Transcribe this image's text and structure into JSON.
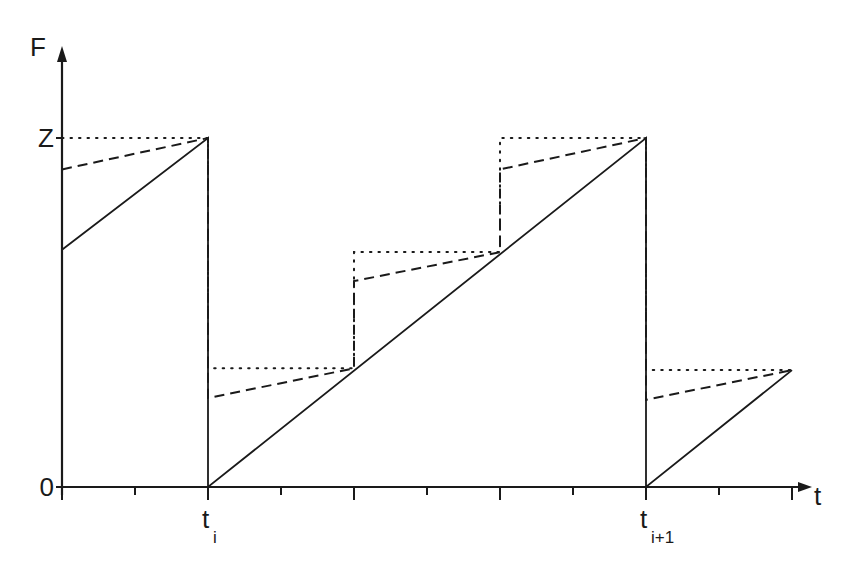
{
  "chart_data": {
    "type": "line",
    "title": "",
    "xlabel": "t",
    "ylabel": "F",
    "y_tick_labels": [
      {
        "label": "0",
        "value": 0
      },
      {
        "label": "Z",
        "value": 1
      }
    ],
    "x_tick_labels": [
      {
        "base": "t",
        "sub": "i",
        "value": 2
      },
      {
        "base": "t",
        "sub": "i+1",
        "value": 8
      }
    ],
    "x_ticks": [
      0,
      1,
      2,
      3,
      4,
      5,
      6,
      7,
      8,
      9,
      10
    ],
    "xlim": [
      0,
      10.2
    ],
    "ylim": [
      0,
      1.0
    ],
    "grid": false,
    "y_units_note": "fraction of Z",
    "series": [
      {
        "name": "solid",
        "style": "solid",
        "points": [
          [
            0,
            0.68
          ],
          [
            2,
            1.0
          ],
          [
            2,
            0
          ],
          [
            8,
            1.0
          ],
          [
            8,
            0
          ],
          [
            10,
            0.335
          ]
        ]
      },
      {
        "name": "dashed",
        "style": "dashed",
        "points": [
          [
            0,
            0.91
          ],
          [
            2,
            1.0
          ],
          [
            2,
            0.255
          ],
          [
            4,
            0.34
          ],
          [
            4,
            0.59
          ],
          [
            6,
            0.673
          ],
          [
            6,
            0.91
          ],
          [
            8,
            1.0
          ],
          [
            8,
            0.25
          ],
          [
            10,
            0.335
          ]
        ]
      },
      {
        "name": "dotted",
        "style": "dotted",
        "points": [
          [
            0,
            1.0
          ],
          [
            2,
            1.0
          ],
          [
            2,
            0.34
          ],
          [
            4,
            0.34
          ],
          [
            4,
            0.673
          ],
          [
            6,
            0.673
          ],
          [
            6,
            1.0
          ],
          [
            8,
            1.0
          ],
          [
            8,
            0.335
          ],
          [
            10,
            0.335
          ]
        ]
      }
    ]
  }
}
